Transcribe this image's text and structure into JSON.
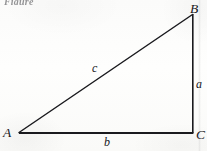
{
  "figure": {
    "caption_fragment": "Figure",
    "background_color": "#fdfdfc",
    "ink_color": "#1a1a1e",
    "vertices": [
      {
        "id": "A",
        "label": "A",
        "x": 19,
        "y": 133
      },
      {
        "id": "B",
        "label": "B",
        "x": 193,
        "y": 14
      },
      {
        "id": "C",
        "label": "C",
        "x": 193,
        "y": 133
      }
    ],
    "sides": [
      {
        "id": "a",
        "label": "a",
        "from": "B",
        "to": "C",
        "orientation": "vertical"
      },
      {
        "id": "b",
        "label": "b",
        "from": "A",
        "to": "C",
        "orientation": "horizontal"
      },
      {
        "id": "c",
        "label": "c",
        "from": "A",
        "to": "B",
        "orientation": "hypotenuse"
      }
    ]
  }
}
